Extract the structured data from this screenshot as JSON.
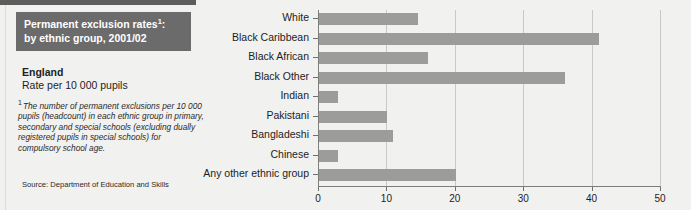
{
  "figure": {
    "title_lines": [
      "Permanent exclusion rates",
      "by ethnic group, 2001/02"
    ],
    "title_footnote_mark": "1",
    "title_colon": ":",
    "region": "England",
    "rate_label": "Rate per 10 000 pupils",
    "footnote_mark": "1",
    "footnote_text": "The number of permanent exclusions per 10 000 pupils (headcount) in each ethnic group in primary, secondary and special schools (excluding dually registered pupils in special schools) for compulsory school age.",
    "source": "Source: Department of Education and Skills",
    "colors": {
      "title_bar": "#6b6b6b",
      "title_text": "#ffffff",
      "bar_fill": "#9c9c9a",
      "background": "#f1f1ef",
      "gridline": "#c9c9c7",
      "axis": "#7d7d7b"
    }
  },
  "chart_data": {
    "type": "bar",
    "orientation": "horizontal",
    "subtitle": "England — Rate per 10 000 pupils",
    "xlabel": "",
    "ylabel": "",
    "categories": [
      "White",
      "Black Caribbean",
      "Black African",
      "Black Other",
      "Indian",
      "Pakistani",
      "Bangladeshi",
      "Chinese",
      "Any other ethnic group"
    ],
    "values": [
      14.5,
      41,
      16,
      36,
      2.8,
      10,
      10.8,
      2.8,
      20
    ],
    "xlim": [
      0,
      50
    ],
    "xticks": [
      0,
      10,
      20,
      30,
      40,
      50
    ],
    "xtick_labels": [
      "0",
      "10",
      "20",
      "30",
      "40",
      "50"
    ],
    "grid": true,
    "grid_axis": "x",
    "legend": false
  }
}
